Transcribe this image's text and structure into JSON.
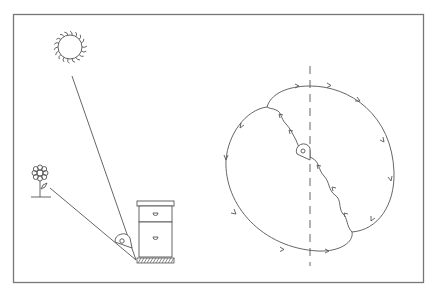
{
  "diagram": {
    "colors": {
      "background": "#ffffff",
      "stroke": "#555555",
      "frame": "#777777"
    },
    "left_panel": {
      "elements": [
        "sun",
        "flower",
        "beehive",
        "angle-marker",
        "sun-line",
        "flower-line",
        "ground"
      ]
    },
    "right_panel": {
      "elements": [
        "vertical-dashed-axis",
        "dance-loop",
        "waggle-run",
        "bee-marker",
        "direction-arrows"
      ]
    }
  }
}
